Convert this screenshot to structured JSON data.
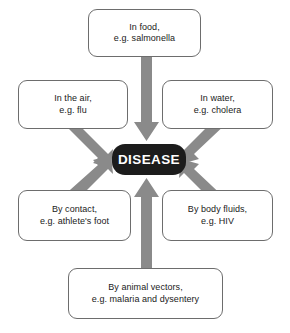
{
  "diagram": {
    "type": "converging-arrow-diagram",
    "center": {
      "label": "DISEASE",
      "fill_color": "#1c1c1c",
      "text_color": "#ffffff"
    },
    "arrow_color": "#8a8a8a",
    "box_border_color": "#6d6d6d",
    "box_fill_color": "#ffffff",
    "nodes": [
      {
        "id": "food",
        "line1": "In food,",
        "line2": "e.g. salmonella",
        "position": "top",
        "arrow_direction": "down"
      },
      {
        "id": "air",
        "line1": "In the air,",
        "line2": "e.g. flu",
        "position": "upper-left",
        "arrow_direction": "down-right"
      },
      {
        "id": "water",
        "line1": "In water,",
        "line2": "e.g. cholera",
        "position": "upper-right",
        "arrow_direction": "down-left"
      },
      {
        "id": "contact",
        "line1": "By contact,",
        "line2": "e.g. athlete's foot",
        "position": "lower-left",
        "arrow_direction": "up-right"
      },
      {
        "id": "fluids",
        "line1": "By body fluids,",
        "line2": "e.g. HIV",
        "position": "lower-right",
        "arrow_direction": "up-left"
      },
      {
        "id": "vectors",
        "line1": "By animal vectors,",
        "line2": "e.g. malaria and dysentery",
        "position": "bottom",
        "arrow_direction": "up"
      }
    ]
  }
}
